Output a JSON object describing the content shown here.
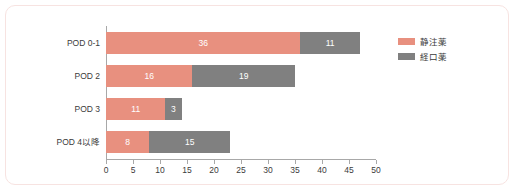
{
  "chart_data": {
    "type": "bar",
    "orientation": "horizontal",
    "stacked": true,
    "title": "",
    "xlabel": "",
    "ylabel": "",
    "xlim": [
      0,
      50
    ],
    "xticks": [
      0,
      5,
      10,
      15,
      20,
      25,
      30,
      35,
      40,
      45,
      50
    ],
    "grid": false,
    "legend_position": "top-right",
    "categories": [
      "POD 0-1",
      "POD 2",
      "POD 3",
      "POD 4以降"
    ],
    "series": [
      {
        "name": "静注薬",
        "color": "#e8907f",
        "values": [
          36,
          16,
          11,
          8
        ]
      },
      {
        "name": "経口薬",
        "color": "#808080",
        "values": [
          11,
          19,
          3,
          15
        ]
      }
    ]
  },
  "frame": {
    "border_color": "#f7e3e1",
    "background": "#ffffff"
  },
  "axis": {
    "line_color": "#a8a8a8",
    "tick_label_color": "#3b3b3b"
  },
  "labels": {
    "data_label_color": "#ffffff"
  }
}
